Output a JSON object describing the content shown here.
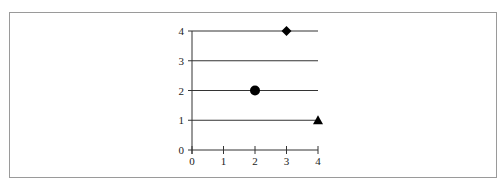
{
  "chart_data": {
    "type": "scatter",
    "title": "",
    "xlabel": "",
    "ylabel": "",
    "xlim": [
      0,
      4
    ],
    "ylim": [
      0,
      4
    ],
    "x_ticks": [
      "0",
      "1",
      "2",
      "3",
      "4"
    ],
    "y_ticks": [
      "0",
      "1",
      "2",
      "3",
      "4"
    ],
    "grid": "horizontal lines at y=1,2,3,4",
    "legend": null,
    "points": [
      {
        "x": 3,
        "y": 4,
        "marker": "diamond"
      },
      {
        "x": 2,
        "y": 2,
        "marker": "circle"
      },
      {
        "x": 4,
        "y": 1,
        "marker": "triangle"
      }
    ]
  },
  "colors": {
    "frame": "#9a9a9a",
    "axis": "#333333",
    "marker": "#000000"
  }
}
